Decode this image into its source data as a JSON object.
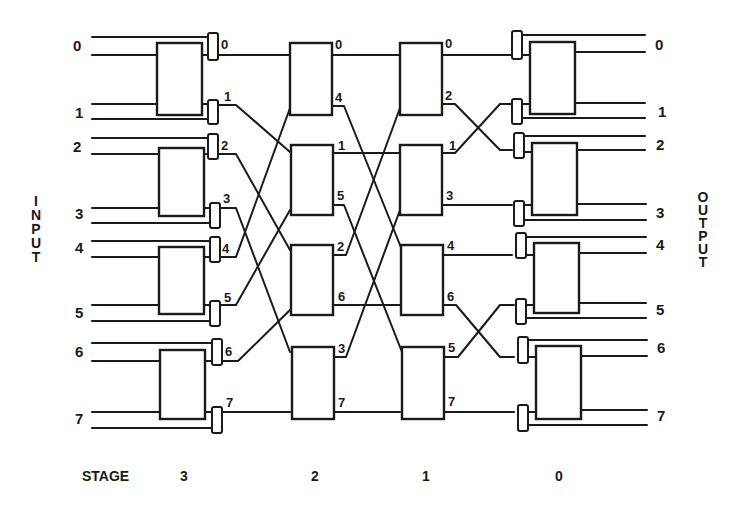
{
  "diagram": {
    "title": "",
    "side_labels": {
      "input": "INPUT",
      "output": "OUTPUT"
    },
    "stage_label": "STAGE",
    "stages": [
      "3",
      "2",
      "1",
      "0"
    ],
    "inputs": [
      "0",
      "1",
      "2",
      "3",
      "4",
      "5",
      "6",
      "7"
    ],
    "outputs": [
      "0",
      "1",
      "2",
      "3",
      "4",
      "5",
      "6",
      "7"
    ],
    "stage3_ports": [
      "0",
      "1",
      "2",
      "3",
      "4",
      "5",
      "6",
      "7"
    ],
    "stage2_ports": [
      "0",
      "4",
      "1",
      "5",
      "2",
      "6",
      "3",
      "7"
    ],
    "stage1_ports": [
      "0",
      "2",
      "1",
      "3",
      "4",
      "6",
      "5",
      "7"
    ],
    "colors": {
      "ink": "#1a1a1a",
      "background": "#ffffff"
    }
  }
}
